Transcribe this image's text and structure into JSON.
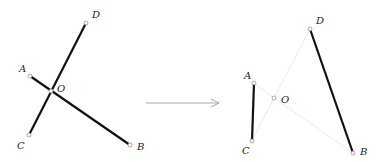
{
  "left_figure": {
    "points": {
      "A": {
        "label": "A",
        "x": 30,
        "y": 76,
        "lx": 19,
        "ly": 72
      },
      "B": {
        "label": "B",
        "x": 130,
        "y": 145,
        "lx": 137,
        "ly": 150
      },
      "C": {
        "label": "C",
        "x": 29,
        "y": 135,
        "lx": 17,
        "ly": 149
      },
      "D": {
        "label": "D",
        "x": 86,
        "y": 23,
        "lx": 92,
        "ly": 18
      },
      "O": {
        "label": "O",
        "x": 51,
        "y": 91,
        "lx": 57,
        "ly": 92
      }
    },
    "segments": [
      {
        "name": "segment-AB",
        "from": "A",
        "to": "B",
        "style": "bold"
      },
      {
        "name": "segment-CD",
        "from": "C",
        "to": "D",
        "style": "bold"
      }
    ]
  },
  "arrow": {
    "x1": 146,
    "y1": 103,
    "x2": 219,
    "y2": 103,
    "color": "#aaaaaa"
  },
  "right_figure": {
    "points": {
      "A": {
        "label": "A",
        "x": 254,
        "y": 83,
        "lx": 244,
        "ly": 79
      },
      "B": {
        "label": "B",
        "x": 353,
        "y": 153,
        "lx": 360,
        "ly": 155
      },
      "C": {
        "label": "C",
        "x": 252,
        "y": 141,
        "lx": 242,
        "ly": 154
      },
      "D": {
        "label": "D",
        "x": 310,
        "y": 29,
        "lx": 316,
        "ly": 24
      },
      "O": {
        "label": "O",
        "x": 274,
        "y": 98,
        "lx": 281,
        "ly": 103
      }
    },
    "segments": [
      {
        "name": "segment-AC",
        "from": "A",
        "to": "C",
        "style": "bold"
      },
      {
        "name": "segment-DB",
        "from": "D",
        "to": "B",
        "style": "bold"
      },
      {
        "name": "segment-AO",
        "from": "A",
        "to": "O",
        "style": "faint"
      },
      {
        "name": "segment-OD",
        "from": "O",
        "to": "D",
        "style": "faint"
      },
      {
        "name": "segment-OB",
        "from": "O",
        "to": "B",
        "style": "faint"
      },
      {
        "name": "segment-CO",
        "from": "C",
        "to": "O",
        "style": "faint"
      }
    ]
  },
  "colors": {
    "bold": "#111111",
    "faint": "#e4e4e4",
    "point_stroke": "#888888"
  }
}
